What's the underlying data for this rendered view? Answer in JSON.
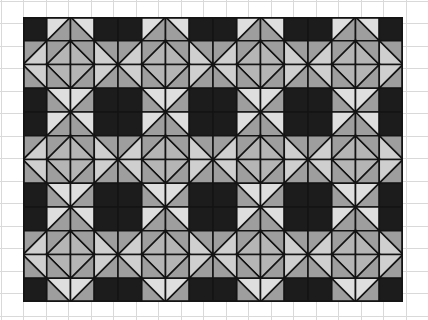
{
  "canvas": {
    "width": 428,
    "height": 320,
    "background": "#ffffff"
  },
  "graph_paper": {
    "line_color": "#d9d9d9",
    "cell_size": 22.5,
    "origin_x": 0.5,
    "origin_y": 0.5
  },
  "quilt": {
    "title": "Quilt block pattern on graph paper",
    "origin_x": 23,
    "origin_y": 17,
    "cell_size": 23.75,
    "cols": 16,
    "rows": 12,
    "blocks_across": 4,
    "blocks_down": 3,
    "seam_color": "#141414",
    "seam_width": 1.6,
    "fabric_palette": {
      "dark": "#1c1c1c",
      "medium_dark": "#8a8a8a",
      "medium": "#9e9e9e",
      "light_medium": "#b5b5b5",
      "light": "#cfcfcf",
      "very_light": "#dedede"
    },
    "block_name": "star-and-square quilt block",
    "block_size_cells": 4,
    "block_units": [
      {
        "r": 0,
        "c": 0,
        "kind": "solid",
        "fill": "dark"
      },
      {
        "r": 0,
        "c": 1,
        "kind": "hst_tl",
        "a": "medium",
        "b": "very_light"
      },
      {
        "r": 0,
        "c": 2,
        "kind": "hst_tr",
        "a": "very_light",
        "b": "medium"
      },
      {
        "r": 0,
        "c": 3,
        "kind": "solid",
        "fill": "dark"
      },
      {
        "r": 1,
        "c": 0,
        "kind": "hst_tl",
        "a": "light",
        "b": "medium"
      },
      {
        "r": 1,
        "c": 1,
        "kind": "hst_br",
        "a": "medium",
        "b": "light_medium"
      },
      {
        "r": 1,
        "c": 2,
        "kind": "hst_bl",
        "a": "light_medium",
        "b": "medium"
      },
      {
        "r": 1,
        "c": 3,
        "kind": "hst_tr",
        "a": "medium",
        "b": "light"
      },
      {
        "r": 2,
        "c": 0,
        "kind": "hst_bl",
        "a": "medium",
        "b": "light"
      },
      {
        "r": 2,
        "c": 1,
        "kind": "hst_tr",
        "a": "light_medium",
        "b": "medium"
      },
      {
        "r": 2,
        "c": 2,
        "kind": "hst_tl",
        "a": "medium",
        "b": "light_medium"
      },
      {
        "r": 2,
        "c": 3,
        "kind": "hst_br",
        "a": "light",
        "b": "medium"
      },
      {
        "r": 3,
        "c": 0,
        "kind": "solid",
        "fill": "dark"
      },
      {
        "r": 3,
        "c": 1,
        "kind": "hst_bl",
        "a": "medium",
        "b": "very_light"
      },
      {
        "r": 3,
        "c": 2,
        "kind": "hst_br",
        "a": "very_light",
        "b": "medium"
      },
      {
        "r": 3,
        "c": 3,
        "kind": "solid",
        "fill": "dark"
      }
    ],
    "center_overlay": {
      "description": "dark four-patch squares sit at each block corner junction",
      "fill": "dark"
    }
  }
}
